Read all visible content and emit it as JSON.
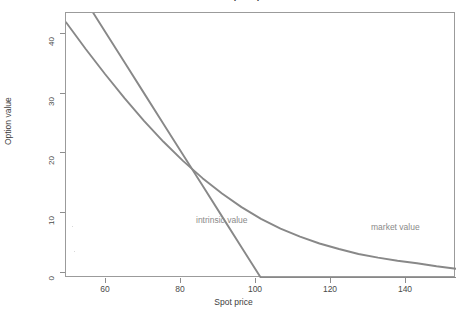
{
  "chart_data": {
    "type": "line",
    "title": "Value of a put option",
    "xlabel": "Spot price",
    "ylabel": "Option value",
    "xlim": [
      50,
      150
    ],
    "ylim": [
      0,
      43
    ],
    "grid": false,
    "legend_position": "in-plot annotations",
    "xticks": [
      60,
      80,
      100,
      120,
      140
    ],
    "yticks": [
      0,
      10,
      20,
      30,
      40
    ],
    "series": [
      {
        "name": "intrinsic value",
        "color": "#888888",
        "annotation": "intrinsic value",
        "annotation_x": 72,
        "annotation_y": 10.5,
        "description": "Payoff of a put struck at 100: max(100 - S, 0)",
        "x": [
          50,
          55,
          60,
          65,
          70,
          75,
          80,
          85,
          90,
          95,
          100,
          105,
          110,
          120,
          130,
          140,
          150
        ],
        "values": [
          50,
          45,
          40,
          35,
          30,
          25,
          20,
          15,
          10,
          5,
          0,
          0,
          0,
          0,
          0,
          0,
          0
        ]
      },
      {
        "name": "market value",
        "color": "#888888",
        "annotation": "market value",
        "annotation_x": 118,
        "annotation_y": 9.5,
        "description": "Black-Scholes put value, convex and everywhere above intrinsic value",
        "x": [
          50,
          55,
          60,
          65,
          70,
          75,
          80,
          85,
          90,
          95,
          100,
          105,
          110,
          115,
          120,
          125,
          130,
          135,
          140,
          145,
          150
        ],
        "values": [
          41.5,
          37.2,
          33.1,
          29.2,
          25.5,
          22.1,
          19.0,
          16.2,
          13.7,
          11.5,
          9.6,
          8.0,
          6.7,
          5.6,
          4.7,
          3.9,
          3.3,
          2.8,
          2.4,
          1.9,
          1.5
        ]
      }
    ],
    "crossing_point": {
      "x": 84,
      "y": 17
    }
  },
  "axes": {
    "y_tick_labels": [
      "0",
      "10",
      "20",
      "30",
      "40"
    ],
    "x_tick_labels": [
      "60",
      "80",
      "100",
      "120",
      "140"
    ],
    "y_title": "Option value",
    "x_title": "Spot price"
  },
  "annotations": {
    "intrinsic": "intrinsic value",
    "market": "market value"
  },
  "colors": {
    "series_line": "#888888",
    "axis": "#8d8d8d",
    "tick_text": "#4a4a4a",
    "annotation_text": "#8a8a8a",
    "background": "#ffffff"
  }
}
